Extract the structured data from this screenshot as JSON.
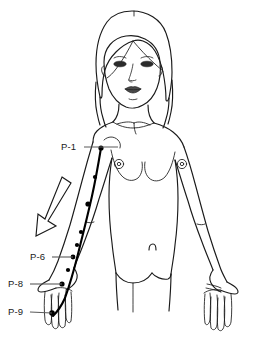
{
  "diagram": {
    "background_color": "#ffffff",
    "line_color": "#1a1a1a",
    "meridian_color": "#000000",
    "leader_color": "#5a5a5a"
  },
  "labels": [
    {
      "id": "p1",
      "text": "P-1",
      "x": 61,
      "y": 142,
      "leader": {
        "x1": 82,
        "y1": 147,
        "x2": 118,
        "y2": 147
      }
    },
    {
      "id": "p6",
      "text": "P-6",
      "x": 30,
      "y": 252,
      "leader": {
        "x1": 51,
        "y1": 257,
        "x2": 68,
        "y2": 257
      }
    },
    {
      "id": "p8",
      "text": "P-8",
      "x": 8,
      "y": 279,
      "leader": {
        "x1": 29,
        "y1": 284,
        "x2": 57,
        "y2": 284
      }
    },
    {
      "id": "p9",
      "text": "P-9",
      "x": 8,
      "y": 306,
      "leader": {
        "x1": 29,
        "y1": 311,
        "x2": 47,
        "y2": 311
      }
    }
  ],
  "meridian": {
    "name": "Pericardium",
    "abbreviation": "P",
    "side": "left arm",
    "path": "M101,148 C99,160 96,178 92,196 C88,214 83,234 78,254 C74,270 70,284 65,298 C61,307 57,312 53,316",
    "points": [
      {
        "label": "P-1",
        "x": 101,
        "y": 148
      },
      {
        "label": "P-3",
        "x": 86,
        "y": 204
      },
      {
        "label": "P-5",
        "x": 72,
        "y": 245
      },
      {
        "label": "P-6",
        "x": 69,
        "y": 257
      },
      {
        "label": "P-7",
        "x": 64,
        "y": 270
      },
      {
        "label": "P-8",
        "x": 58,
        "y": 284
      },
      {
        "label": "P-9",
        "x": 47,
        "y": 311
      }
    ]
  },
  "arrow": {
    "name": "flow-direction-arrow",
    "direction": "downward along arm",
    "points": "62,177 71,182 48,222 56,227 38,236 39,215 46,219"
  },
  "anatomy": {
    "head": "oval face with center-parted shoulder-length hair",
    "features": [
      "eyes",
      "nose",
      "lips",
      "neck"
    ],
    "torso": [
      "shoulders",
      "breasts",
      "nipples",
      "navel",
      "hips"
    ],
    "limbs": [
      "left arm extended down",
      "right arm extended down",
      "both hands with fingers"
    ]
  }
}
